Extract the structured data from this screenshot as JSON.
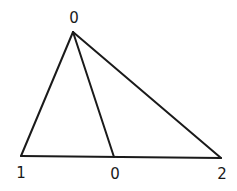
{
  "diagram": {
    "type": "triangle-subdivision",
    "stroke_color": "#1a1a1a",
    "background": "#ffffff",
    "vertices": [
      {
        "id": "apex",
        "label": "0",
        "x": 73,
        "y": 32
      },
      {
        "id": "bottom-left",
        "label": "1",
        "x": 21,
        "y": 156
      },
      {
        "id": "bottom-mid",
        "label": "0",
        "x": 114,
        "y": 157
      },
      {
        "id": "bottom-right",
        "label": "2",
        "x": 221,
        "y": 158
      }
    ],
    "edges": [
      [
        "apex",
        "bottom-left"
      ],
      [
        "apex",
        "bottom-mid"
      ],
      [
        "apex",
        "bottom-right"
      ],
      [
        "bottom-left",
        "bottom-right"
      ]
    ],
    "labels": {
      "apex": "0",
      "bottom_left": "1",
      "bottom_mid": "0",
      "bottom_right": "2"
    }
  }
}
